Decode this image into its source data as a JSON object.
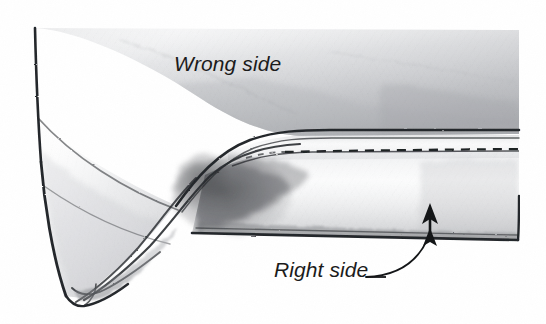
{
  "figure": {
    "kind": "pencil-illustration",
    "background_color": "#ffffff",
    "ink_color": "#1b1b1b",
    "graphite_color": "#6f7174",
    "shadow_color": "#3a3c3f",
    "width": 546,
    "height": 324
  },
  "labels": {
    "wrong_side": "Wrong side",
    "right_side": "Right side"
  },
  "annotations": {
    "leader_line": {
      "name": "right-side-leader",
      "has_arrowhead": true,
      "arrow_target": "right side fabric surface"
    },
    "dash": "—"
  },
  "features": {
    "stitch_line": "dashed machine stitching",
    "fold_edge": "upper hem fold",
    "hem_edge": "lower raw edge",
    "drape": "fabric turned back at left"
  }
}
